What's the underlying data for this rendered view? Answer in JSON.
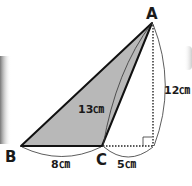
{
  "diagram": {
    "type": "geometry-triangle",
    "points": {
      "A": {
        "label": "A"
      },
      "B": {
        "label": "B"
      },
      "C": {
        "label": "C"
      }
    },
    "measures": {
      "AC": "13㎝",
      "height": "12㎝",
      "BC": "8㎝",
      "C_to_foot": "5㎝"
    },
    "colors": {
      "shade": "#b8b8b8",
      "stroke": "#111111",
      "aux": "#333333"
    }
  }
}
